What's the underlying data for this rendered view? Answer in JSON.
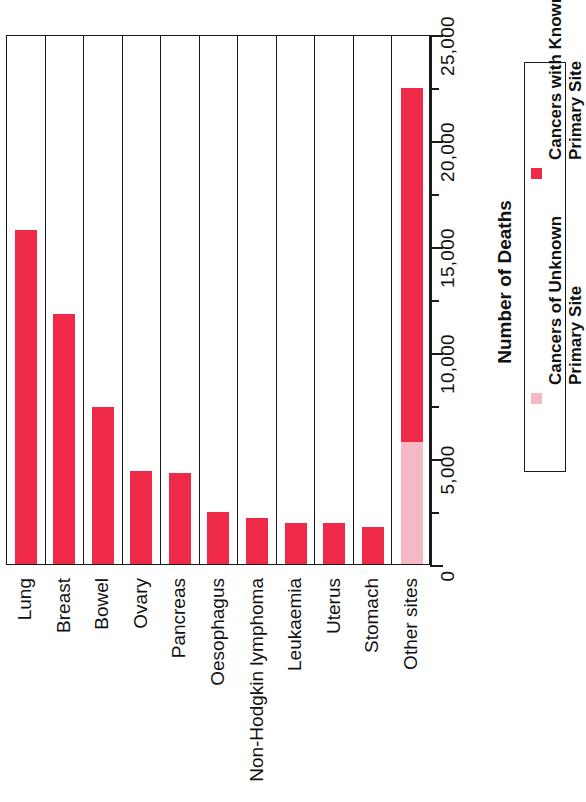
{
  "chart_data": {
    "type": "bar",
    "title": "",
    "subtitle": "",
    "orientation": "vertical-bars-rotated-90",
    "stacked": true,
    "grid": false,
    "xlabel": "",
    "ylabel": "Number of Deaths",
    "ylim": [
      0,
      25000
    ],
    "ytick_interval": 5000,
    "yminor_interval": 2500,
    "ytick_labels": [
      "0",
      "5,000",
      "10,000",
      "15,000",
      "20,000",
      "25,000"
    ],
    "ytick_values": [
      0,
      5000,
      10000,
      15000,
      20000,
      25000
    ],
    "categories": [
      "Lung",
      "Breast",
      "Bowel",
      "Ovary",
      "Pancreas",
      "Oesophagus",
      "Non-Hodgkin lymphoma",
      "Leukaemia",
      "Uterus",
      "Stomach",
      "Other sites"
    ],
    "series": [
      {
        "name": "Cancers with Known Primary Site",
        "color": "#EE2A48",
        "values": [
          15750,
          11800,
          7400,
          4400,
          4300,
          2450,
          2150,
          1950,
          1950,
          1750,
          16700
        ]
      },
      {
        "name": "Cancers of Unknown Primary Site",
        "color": "#F4B9C4",
        "values": [
          0,
          0,
          0,
          0,
          0,
          0,
          0,
          0,
          0,
          0,
          5750
        ]
      }
    ],
    "totals": [
      15750,
      11800,
      7400,
      4400,
      4300,
      2450,
      2150,
      1950,
      1950,
      1750,
      22450
    ],
    "legend_position": "right",
    "legend": [
      {
        "label": "Cancers of Unknown Primary Site",
        "label_line1": "Cancers of Unknown",
        "label_line2": "Primary Site",
        "color": "#F4B9C4",
        "swatch": "square-swatch-pink"
      },
      {
        "label": "Cancers with Known Primary Site",
        "label_line1": "Cancers with Known",
        "label_line2": "Primary Site",
        "color": "#EE2A48",
        "swatch": "square-swatch-red"
      }
    ],
    "colors": {
      "known_primary": "#EE2A48",
      "unknown_primary": "#F4B9C4",
      "axis": "#1a1a1a",
      "background": "#ffffff"
    }
  }
}
